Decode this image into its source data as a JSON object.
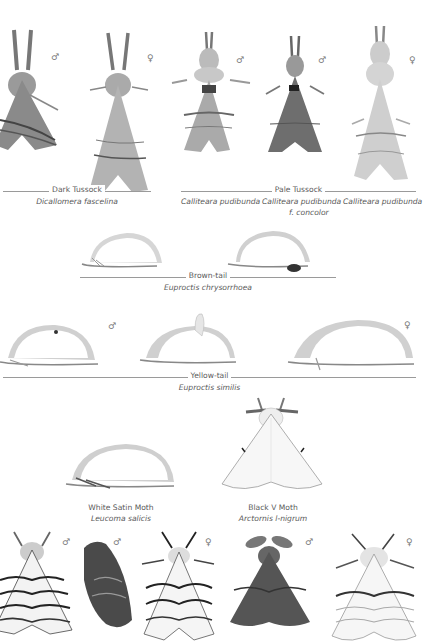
{
  "plate": {
    "sections": [
      {
        "id": "dark-tussock",
        "common_name": "Dark Tussock",
        "scientific_names": [
          "Dicallomera fascelina"
        ],
        "specimens": [
          {
            "sex": "♂"
          },
          {
            "sex": "♀"
          }
        ]
      },
      {
        "id": "pale-tussock",
        "common_name": "Pale Tussock",
        "scientific_names": [
          "Calliteara pudibunda",
          "Calliteara pudibunda",
          "f. concolor",
          "Calliteara pudibunda"
        ],
        "specimens": [
          {
            "sex": "♂"
          },
          {
            "sex": "♂"
          },
          {
            "sex": "♀"
          }
        ]
      },
      {
        "id": "brown-tail",
        "common_name": "Brown-tail",
        "scientific_names": [
          "Euproctis chrysorrhoea"
        ],
        "specimens": [
          {
            "sex": ""
          },
          {
            "sex": ""
          }
        ]
      },
      {
        "id": "yellow-tail",
        "common_name": "Yellow-tail",
        "scientific_names": [
          "Euproctis similis"
        ],
        "specimens": [
          {
            "sex": "♂"
          },
          {
            "sex": ""
          },
          {
            "sex": "♀"
          }
        ]
      },
      {
        "id": "white-satin",
        "common_name": "White Satin Moth",
        "scientific_names": [
          "Leucoma salicis"
        ]
      },
      {
        "id": "black-v",
        "common_name": "Black V Moth",
        "scientific_names": [
          "Arctornis l-nigrum"
        ]
      },
      {
        "id": "bottom-row",
        "specimens": [
          {
            "sex": "♂"
          },
          {
            "sex": "♂"
          },
          {
            "sex": "♀"
          },
          {
            "sex": "♂"
          },
          {
            "sex": "♀"
          }
        ]
      }
    ]
  },
  "colors": {
    "background": "#ffffff",
    "text": "#5a5a5a",
    "rule": "#9a9a9a"
  }
}
